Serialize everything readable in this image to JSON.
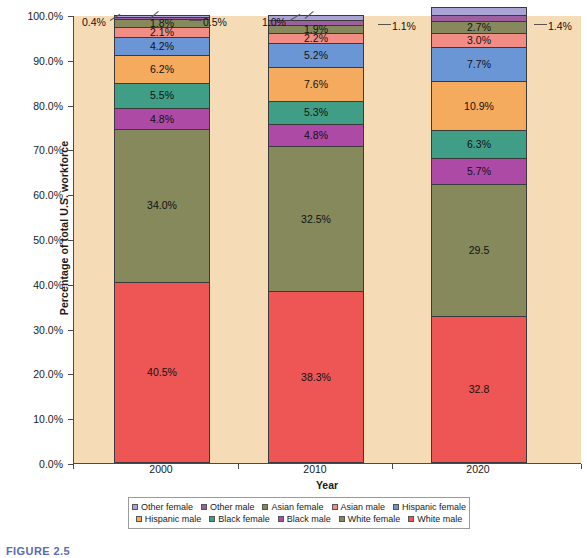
{
  "caption": "FIGURE 2.5",
  "chart_data": {
    "type": "bar",
    "subtype": "100% stacked bar",
    "title": "",
    "subtitle": "",
    "xlabel": "Year",
    "ylabel": "Percentage of total U.S. workforce",
    "categories": [
      "2000",
      "2010",
      "2020"
    ],
    "ylim": [
      0,
      100
    ],
    "ytick_labels": [
      "0.0%",
      "10.0%",
      "20.0%",
      "30.0%",
      "40.0%",
      "50.0%",
      "60.0%",
      "70.0%",
      "80.0%",
      "90.0%",
      "100.0%"
    ],
    "ytick_values": [
      0,
      10,
      20,
      30,
      40,
      50,
      60,
      70,
      80,
      90,
      100
    ],
    "grid": false,
    "legend_position": "bottom",
    "plot_background": "#f6dcb6",
    "series": [
      {
        "name": "White male",
        "color": "#ee5555",
        "values": [
          40.5,
          38.3,
          32.8
        ],
        "labels": [
          "40.5%",
          "38.3%",
          "32.8"
        ]
      },
      {
        "name": "White female",
        "color": "#85895c",
        "values": [
          34.0,
          32.5,
          29.5
        ],
        "labels": [
          "34.0%",
          "32.5%",
          "29.5"
        ]
      },
      {
        "name": "Black male",
        "color": "#b martin"
      }
    ]
  },
  "chart": {
    "xlabel": "Year",
    "ylabel": "Percentage of total U.S. workforce",
    "categories": [
      "2000",
      "2010",
      "2020"
    ],
    "ytick_labels": [
      "100.0%",
      "90.0%",
      "80.0%",
      "70.0%",
      "60.0%",
      "50.0%",
      "40.0%",
      "30.0%",
      "20.0%",
      "10.0%",
      "0.0%"
    ]
  },
  "legend": {
    "row1": [
      {
        "label": "Other female",
        "color": "#a9a3d6"
      },
      {
        "label": "Other male",
        "color": "#9e5fa0"
      },
      {
        "label": "Asian female",
        "color": "#85895c"
      },
      {
        "label": "Asian male",
        "color": "#f18d85"
      },
      {
        "label": "Hispanic female",
        "color": "#6b96d6"
      }
    ],
    "row2": [
      {
        "label": "Hispanic male",
        "color": "#f4ab5e"
      },
      {
        "label": "Black female",
        "color": "#3f9e85"
      },
      {
        "label": "Black male",
        "color": "#ad4aa6"
      },
      {
        "label": "White female",
        "color": "#85895c"
      },
      {
        "label": "White male",
        "color": "#ee5555"
      }
    ]
  },
  "bars": [
    {
      "year": "2000",
      "segments": [
        {
          "name": "White male",
          "value": 40.5,
          "label": "40.5%",
          "color": "#ee5555",
          "inside": true
        },
        {
          "name": "White female",
          "value": 34.0,
          "label": "34.0%",
          "color": "#85895c",
          "inside": true
        },
        {
          "name": "Black male",
          "value": 4.8,
          "label": "4.8%",
          "color": "#ad4aa6",
          "inside": true
        },
        {
          "name": "Black female",
          "value": 5.5,
          "label": "5.5%",
          "color": "#3f9e85",
          "inside": true
        },
        {
          "name": "Hispanic male",
          "value": 6.2,
          "label": "6.2%",
          "color": "#f4ab5e",
          "inside": true
        },
        {
          "name": "Hispanic female",
          "value": 4.2,
          "label": "4.2%",
          "color": "#6b96d6",
          "inside": true
        },
        {
          "name": "Asian male",
          "value": 2.1,
          "label": "2.1%",
          "color": "#f18d85",
          "inside": true
        },
        {
          "name": "Asian female",
          "value": 1.8,
          "label": "1.8%",
          "color": "#85895c",
          "inside": true
        },
        {
          "name": "Other male",
          "value": 0.5,
          "label": "0.5%",
          "color": "#9e5fa0",
          "inside": false
        },
        {
          "name": "Other female",
          "value": 0.4,
          "label": "0.4%",
          "color": "#a9a3d6",
          "inside": false
        }
      ]
    },
    {
      "year": "2010",
      "segments": [
        {
          "name": "White male",
          "value": 38.3,
          "label": "38.3%",
          "color": "#ee5555",
          "inside": true
        },
        {
          "name": "White female",
          "value": 32.5,
          "label": "32.5%",
          "color": "#85895c",
          "inside": true
        },
        {
          "name": "Black male",
          "value": 4.8,
          "label": "4.8%",
          "color": "#ad4aa6",
          "inside": true
        },
        {
          "name": "Black female",
          "value": 5.3,
          "label": "5.3%",
          "color": "#3f9e85",
          "inside": true
        },
        {
          "name": "Hispanic male",
          "value": 7.6,
          "label": "7.6%",
          "color": "#f4ab5e",
          "inside": true
        },
        {
          "name": "Hispanic female",
          "value": 5.2,
          "label": "5.2%",
          "color": "#6b96d6",
          "inside": true
        },
        {
          "name": "Asian male",
          "value": 2.2,
          "label": "2.2%",
          "color": "#f18d85",
          "inside": true
        },
        {
          "name": "Asian female",
          "value": 1.9,
          "label": "1.9%",
          "color": "#85895c",
          "inside": true
        },
        {
          "name": "Other male",
          "value": 1.1,
          "label": "1.1%",
          "color": "#9e5fa0",
          "inside": false
        },
        {
          "name": "Other female",
          "value": 1.0,
          "label": "1.0%",
          "color": "#a9a3d6",
          "inside": false
        }
      ]
    },
    {
      "year": "2020",
      "segments": [
        {
          "name": "White male",
          "value": 32.8,
          "label": "32.8",
          "color": "#ee5555",
          "inside": true
        },
        {
          "name": "White female",
          "value": 29.5,
          "label": "29.5",
          "color": "#85895c",
          "inside": true
        },
        {
          "name": "Black male",
          "value": 5.7,
          "label": "5.7%",
          "color": "#ad4aa6",
          "inside": true
        },
        {
          "name": "Black female",
          "value": 6.3,
          "label": "6.3%",
          "color": "#3f9e85",
          "inside": true
        },
        {
          "name": "Hispanic male",
          "value": 10.9,
          "label": "10.9%",
          "color": "#f4ab5e",
          "inside": true
        },
        {
          "name": "Hispanic female",
          "value": 7.7,
          "label": "7.7%",
          "color": "#6b96d6",
          "inside": true
        },
        {
          "name": "Asian male",
          "value": 3.0,
          "label": "3.0%",
          "color": "#f18d85",
          "inside": true
        },
        {
          "name": "Asian female",
          "value": 2.7,
          "label": "2.7%",
          "color": "#85895c",
          "inside": true
        },
        {
          "name": "Other male",
          "value": 1.4,
          "label": "1.4%",
          "color": "#9e5fa0",
          "inside": false
        },
        {
          "name": "Other female",
          "value": 1.7,
          "label": "",
          "color": "#a9a3d6",
          "inside": false
        }
      ]
    }
  ],
  "callouts": [
    {
      "text": "0.4%",
      "side": "left",
      "bar": 0,
      "x": 82,
      "y": 17
    },
    {
      "text": "0.5%",
      "side": "right",
      "bar": 0,
      "x": 203,
      "y": 17
    },
    {
      "text": "1.0%",
      "side": "left",
      "bar": 1,
      "x": 262,
      "y": 17
    },
    {
      "text": "1.1%",
      "side": "right",
      "bar": 1,
      "x": 392,
      "y": 21
    },
    {
      "text": "1.4%",
      "side": "right",
      "bar": 2,
      "x": 548,
      "y": 21
    }
  ]
}
